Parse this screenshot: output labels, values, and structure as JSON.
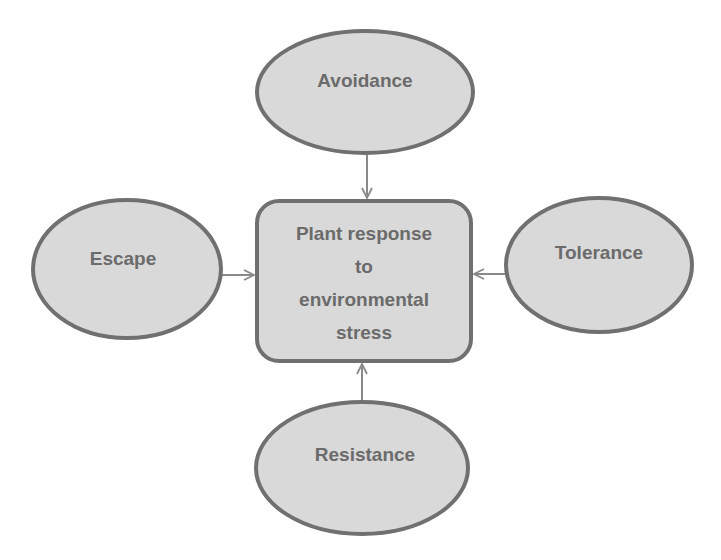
{
  "diagram": {
    "center": {
      "lines": [
        "Plant response",
        "to",
        "environmental",
        "stress"
      ]
    },
    "nodes": [
      {
        "id": "avoidance",
        "label": "Avoidance",
        "position": "top"
      },
      {
        "id": "escape",
        "label": "Escape",
        "position": "left"
      },
      {
        "id": "tolerance",
        "label": "Tolerance",
        "position": "right"
      },
      {
        "id": "resistance",
        "label": "Resistance",
        "position": "bottom"
      }
    ],
    "edges": [
      {
        "from": "avoidance",
        "to": "center"
      },
      {
        "from": "escape",
        "to": "center"
      },
      {
        "from": "tolerance",
        "to": "center"
      },
      {
        "from": "resistance",
        "to": "center"
      }
    ],
    "colors": {
      "fill": "#d9d9d9",
      "stroke": "#707070",
      "text": "#6b6b6b",
      "arrow": "#8a8a8a"
    }
  }
}
